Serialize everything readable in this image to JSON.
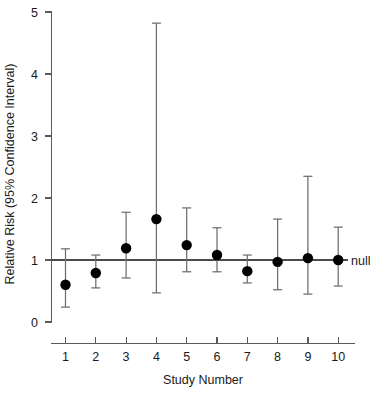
{
  "chart_data": {
    "type": "scatter",
    "title": "",
    "subtitle": "",
    "xlabel": "Study Number",
    "ylabel": "Relative Risk (95% Confidence Interval)",
    "categories": [
      "1",
      "2",
      "3",
      "4",
      "5",
      "6",
      "7",
      "8",
      "9",
      "10"
    ],
    "x": [
      1,
      2,
      3,
      4,
      5,
      6,
      7,
      8,
      9,
      10
    ],
    "values": [
      0.6,
      0.79,
      1.19,
      1.66,
      1.24,
      1.08,
      0.82,
      0.97,
      1.03,
      1.0
    ],
    "ci_lower": [
      0.24,
      0.55,
      0.71,
      0.47,
      0.81,
      0.81,
      0.63,
      0.52,
      0.45,
      0.58
    ],
    "ci_upper": [
      1.18,
      1.08,
      1.77,
      4.82,
      1.84,
      1.52,
      1.08,
      1.66,
      2.35,
      1.53
    ],
    "series": [
      {
        "name": "Relative Risk",
        "values": [
          0.6,
          0.79,
          1.19,
          1.66,
          1.24,
          1.08,
          0.82,
          0.97,
          1.03,
          1.0
        ]
      }
    ],
    "points": [
      {
        "study": "1",
        "estimate": 0.6,
        "lower": 0.24,
        "upper": 1.18
      },
      {
        "study": "2",
        "estimate": 0.79,
        "lower": 0.55,
        "upper": 1.08
      },
      {
        "study": "3",
        "estimate": 1.19,
        "lower": 0.71,
        "upper": 1.77
      },
      {
        "study": "4",
        "estimate": 1.66,
        "lower": 0.47,
        "upper": 4.82
      },
      {
        "study": "5",
        "estimate": 1.24,
        "lower": 0.81,
        "upper": 1.84
      },
      {
        "study": "6",
        "estimate": 1.08,
        "lower": 0.81,
        "upper": 1.52
      },
      {
        "study": "7",
        "estimate": 0.82,
        "lower": 0.63,
        "upper": 1.08
      },
      {
        "study": "8",
        "estimate": 0.97,
        "lower": 0.52,
        "upper": 1.66
      },
      {
        "study": "9",
        "estimate": 1.03,
        "lower": 0.45,
        "upper": 2.35
      },
      {
        "study": "10",
        "estimate": 1.0,
        "lower": 0.58,
        "upper": 1.53
      }
    ],
    "ylim": [
      0,
      5
    ],
    "xlim": [
      0.5,
      10.5
    ],
    "yticks": [
      0,
      1,
      2,
      3,
      4,
      5
    ],
    "ytick_labels": [
      "0",
      "1",
      "2",
      "3",
      "4",
      "5"
    ],
    "xtick_labels": [
      "1",
      "2",
      "3",
      "4",
      "5",
      "6",
      "7",
      "8",
      "9",
      "10"
    ],
    "grid": false,
    "legend": "none",
    "annotations": [
      {
        "name": "null-reference-line",
        "label": "null",
        "y": 1.0
      }
    ]
  },
  "axis": {
    "y_title": "Relative Risk (95% Confidence Interval)",
    "x_title": "Study Number"
  },
  "labels": {
    "null": "null"
  },
  "colors": {
    "marker": "#000000",
    "whisker": "#6e6e6e",
    "axis": "#5a5a5a",
    "null_line": "#4a4a4a",
    "background": "#ffffff"
  }
}
